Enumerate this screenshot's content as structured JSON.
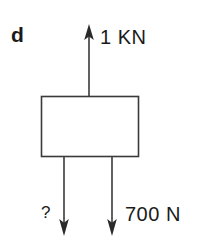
{
  "diagram": {
    "kind": "free-body-diagram",
    "part_label": "d",
    "background_color": "#ffffff",
    "stroke_color": "#3a3a3a",
    "text_color": "#1a1a1a",
    "body": {
      "name": "block",
      "shape": "rectangle",
      "x": 41,
      "y": 96,
      "width": 98,
      "height": 61
    },
    "forces": [
      {
        "id": "top",
        "label": "1 KN",
        "direction": "up",
        "magnitude": 1,
        "unit": "KN",
        "anchor_x": 89,
        "from_y": 96,
        "to_y": 25
      },
      {
        "id": "left-bottom",
        "label": "?",
        "direction": "down",
        "magnitude": null,
        "unit": "",
        "anchor_x": 64,
        "from_y": 157,
        "to_y": 235
      },
      {
        "id": "right-bottom",
        "label": "700 N",
        "direction": "down",
        "magnitude": 700,
        "unit": "N",
        "anchor_x": 112,
        "from_y": 157,
        "to_y": 235
      }
    ]
  }
}
